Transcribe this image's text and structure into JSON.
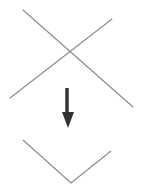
{
  "top_text": {
    "content": "",
    "note_visible": "cut-off illegible text fragment along top edge"
  },
  "diagram": {
    "stroke_color": "#8a8a8a",
    "arrow_color": "#333333",
    "crossed_lines": {
      "line1": {
        "x1": 23,
        "y1": 10,
        "x2": 133,
        "y2": 107
      },
      "line2": {
        "x1": 112,
        "y1": 19,
        "x2": 10,
        "y2": 98
      }
    },
    "arrow": {
      "direction": "down",
      "shaft": {
        "x": 67,
        "y1": 88,
        "y2": 114
      },
      "head": {
        "left_x": 62,
        "right_x": 74,
        "base_y": 112,
        "tip_x": 68,
        "tip_y": 128
      }
    },
    "v_shape": {
      "points": [
        [
          23,
          140
        ],
        [
          71,
          183
        ],
        [
          111,
          151
        ]
      ]
    }
  }
}
